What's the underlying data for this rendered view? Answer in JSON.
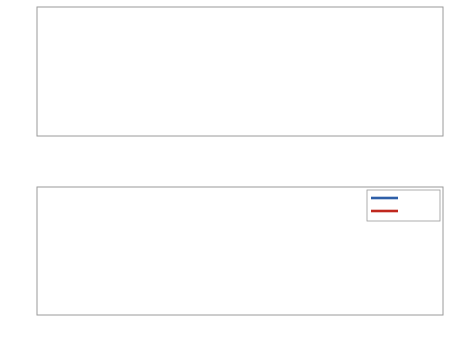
{
  "chart_data": [
    {
      "type": "line",
      "title": "",
      "xlabel": "",
      "ylabel": "filter kernel",
      "xlim": [
        -50,
        50
      ],
      "ylim": [
        0,
        1
      ],
      "xticks": [
        -50,
        -40,
        -30,
        -20,
        -10,
        0,
        10,
        20,
        30,
        40,
        50
      ],
      "yticks": [
        0,
        0.2,
        0.4,
        0.6,
        0.8,
        1
      ],
      "ytick_labels": [
        "0",
        "0.2",
        "0.4",
        "0.6",
        "0.8",
        "1"
      ],
      "grid": true,
      "legend": null,
      "series": [
        {
          "name": "filter kernel",
          "color": "#000000",
          "description": "Gaussian centered at 0, peak 1, sigma ~1.5",
          "x": [
            -50,
            -10,
            -5,
            -4,
            -3,
            -2,
            -1,
            0,
            1,
            2,
            3,
            4,
            5,
            10,
            50
          ],
          "y": [
            0,
            0,
            0.004,
            0.028,
            0.135,
            0.41,
            0.8,
            1.0,
            0.8,
            0.41,
            0.135,
            0.028,
            0.004,
            0,
            0
          ]
        }
      ]
    },
    {
      "type": "line",
      "title": "",
      "xlabel": "x",
      "ylabel": "functions",
      "xlim": [
        -50,
        50
      ],
      "ylim": [
        -4,
        4
      ],
      "xticks": [
        -50,
        -40,
        -30,
        -20,
        -10,
        0,
        10,
        20,
        30,
        40,
        50
      ],
      "yticks": [
        -4,
        -2,
        0,
        2,
        4
      ],
      "grid": true,
      "legend": {
        "position": "upper right",
        "entries": [
          "raw",
          "filtered"
        ]
      },
      "series": [
        {
          "name": "raw",
          "color": "#2e5fa8",
          "description": "noisy sine wave, period 10, amplitude ~2, noise range roughly -3.8 to 3.5"
        },
        {
          "name": "filtered",
          "color": "#c0281e",
          "description": "smooth sine wave, period 10, amplitude ~2.4",
          "x": [
            -50,
            -47.5,
            -45,
            -42.5,
            -40,
            -37.5,
            -35,
            -32.5,
            -30,
            -27.5,
            -25,
            -22.5,
            -20,
            -17.5,
            -15,
            -12.5,
            -10,
            -7.5,
            -5,
            -2.5,
            0,
            2.5,
            5,
            7.5,
            10,
            12.5,
            15,
            17.5,
            20,
            22.5,
            25,
            27.5,
            30,
            32.5,
            35,
            37.5,
            40,
            42.5,
            45,
            47.5,
            50
          ],
          "y": [
            0,
            2.4,
            0,
            -2.4,
            0,
            2.4,
            0,
            -2.4,
            0,
            2.4,
            0,
            -2.4,
            0,
            2.4,
            0,
            -2.4,
            0,
            2.4,
            0,
            -2.4,
            0,
            2.4,
            0,
            -2.4,
            0,
            2.4,
            0,
            -2.4,
            0,
            2.4,
            0,
            -2.4,
            0,
            2.4,
            0,
            -2.4,
            0,
            2.4,
            0,
            -2.4,
            0
          ]
        }
      ]
    }
  ],
  "top_plot": {
    "ylabel": "filter kernel",
    "xtick_labels": [
      "-50",
      "-40",
      "-30",
      "-20",
      "-10",
      "0",
      "10",
      "20",
      "30",
      "40",
      "50"
    ],
    "ytick_labels": [
      "0",
      "0.2",
      "0.4",
      "0.6",
      "0.8",
      "1"
    ]
  },
  "bottom_plot": {
    "ylabel": "functions",
    "xlabel": "x",
    "xtick_labels": [
      "-50",
      "-40",
      "-30",
      "-20",
      "-10",
      "0",
      "10",
      "20",
      "30",
      "40",
      "50"
    ],
    "ytick_labels": [
      "-4",
      "-2",
      "0",
      "2",
      "4"
    ],
    "legend": {
      "raw": "raw",
      "filtered": "filtered"
    }
  },
  "colors": {
    "kernel": "#000000",
    "raw": "#2e5fa8",
    "filtered": "#c0281e",
    "grid": "#e6e6e6",
    "axes": "#9a9a9a"
  }
}
